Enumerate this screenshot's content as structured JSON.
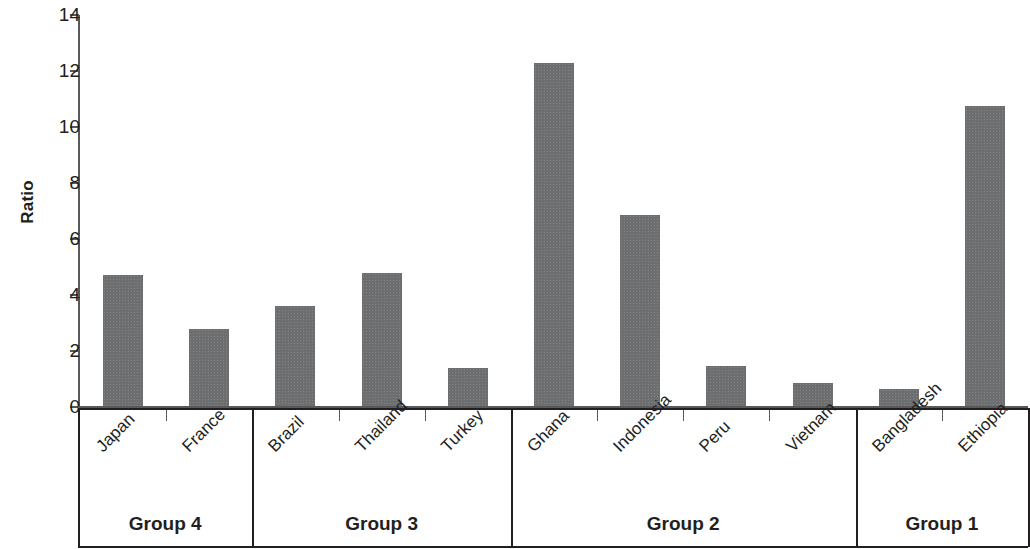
{
  "chart_data": {
    "type": "bar",
    "title": "",
    "xlabel": "",
    "ylabel": "Ratio",
    "ylim": [
      0,
      14
    ],
    "ytick_labels": [
      "0",
      "2",
      "4",
      "6",
      "8",
      "10",
      "12",
      "14"
    ],
    "ytick_values": [
      0,
      2,
      4,
      6,
      8,
      10,
      12,
      14
    ],
    "grid": false,
    "legend": "none",
    "bar_color": "#6d6e70",
    "axis_color": "#58595b",
    "categories": [
      "Japan",
      "France",
      "Brazil",
      "Thailand",
      "Turkey",
      "Ghana",
      "Indonesia",
      "Peru",
      "Vietnam",
      "Bangladesh",
      "Ethiopia"
    ],
    "values": [
      4.7,
      2.8,
      3.6,
      4.8,
      1.4,
      12.3,
      6.85,
      1.45,
      0.85,
      0.65,
      10.75
    ],
    "groups": [
      {
        "label": "Group 4",
        "categories": [
          "Japan",
          "France"
        ]
      },
      {
        "label": "Group 3",
        "categories": [
          "Brazil",
          "Thailand",
          "Turkey"
        ]
      },
      {
        "label": "Group 2",
        "categories": [
          "Ghana",
          "Indonesia",
          "Peru",
          "Vietnam"
        ]
      },
      {
        "label": "Group 1",
        "categories": [
          "Bangladesh",
          "Ethiopia"
        ]
      }
    ]
  },
  "axis": {
    "ylabel": "Ratio",
    "ticks": [
      {
        "label": "14",
        "value": 14
      },
      {
        "label": "12",
        "value": 12
      },
      {
        "label": "10",
        "value": 10
      },
      {
        "label": "8",
        "value": 8
      },
      {
        "label": "6",
        "value": 6
      },
      {
        "label": "4",
        "value": 4
      },
      {
        "label": "2",
        "value": 2
      },
      {
        "label": "0",
        "value": 0
      }
    ]
  },
  "bars": [
    {
      "label": "Japan",
      "value": 4.7
    },
    {
      "label": "France",
      "value": 2.8
    },
    {
      "label": "Brazil",
      "value": 3.6
    },
    {
      "label": "Thailand",
      "value": 4.8
    },
    {
      "label": "Turkey",
      "value": 1.4
    },
    {
      "label": "Ghana",
      "value": 12.3
    },
    {
      "label": "Indonesia",
      "value": 6.85
    },
    {
      "label": "Peru",
      "value": 1.45
    },
    {
      "label": "Vietnam",
      "value": 0.85
    },
    {
      "label": "Bangladesh",
      "value": 0.65
    },
    {
      "label": "Ethiopia",
      "value": 10.75
    }
  ],
  "groups": [
    {
      "label": "Group 4"
    },
    {
      "label": "Group 3"
    },
    {
      "label": "Group 2"
    },
    {
      "label": "Group 1"
    }
  ]
}
